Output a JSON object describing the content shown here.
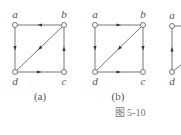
{
  "figure": {
    "caption": "图  5-10",
    "colors": {
      "edge": "#666666",
      "node_fill": "#ffffff",
      "node_stroke": "#666666",
      "text": "#555555"
    },
    "graphs": [
      {
        "id": "a",
        "label": "(a)",
        "label_pos": [
          40,
          100
        ],
        "nodes": [
          {
            "id": "a",
            "label": "a",
            "x": 15,
            "y": 25,
            "lx": 15,
            "ly": 18
          },
          {
            "id": "b",
            "label": "b",
            "x": 64,
            "y": 25,
            "lx": 64,
            "ly": 18
          },
          {
            "id": "c",
            "label": "c",
            "x": 64,
            "y": 72,
            "lx": 64,
            "ly": 85
          },
          {
            "id": "d",
            "label": "d",
            "x": 15,
            "y": 72,
            "lx": 15,
            "ly": 85
          }
        ],
        "edges": [
          {
            "from": "b",
            "to": "a"
          },
          {
            "from": "a",
            "to": "d"
          },
          {
            "from": "b",
            "to": "d"
          },
          {
            "from": "d",
            "to": "c"
          },
          {
            "from": "c",
            "to": "b"
          }
        ]
      },
      {
        "id": "b",
        "label": "(b)",
        "label_pos": [
          118,
          100
        ],
        "nodes": [
          {
            "id": "a",
            "label": "a",
            "x": 95,
            "y": 25,
            "lx": 95,
            "ly": 18
          },
          {
            "id": "b",
            "label": "b",
            "x": 143,
            "y": 25,
            "lx": 143,
            "ly": 18
          },
          {
            "id": "c",
            "label": "c",
            "x": 143,
            "y": 72,
            "lx": 143,
            "ly": 85
          },
          {
            "id": "d",
            "label": "d",
            "x": 95,
            "y": 72,
            "lx": 95,
            "ly": 85
          }
        ],
        "edges": [
          {
            "from": "a",
            "to": "b"
          },
          {
            "from": "a",
            "to": "d"
          },
          {
            "from": "b",
            "to": "d"
          },
          {
            "from": "b",
            "to": "c"
          },
          {
            "from": "d",
            "to": "c"
          }
        ]
      },
      {
        "id": "c",
        "label": "",
        "label_pos": [
          0,
          0
        ],
        "partial": true,
        "nodes": [
          {
            "id": "a",
            "label": "a",
            "x": 172,
            "y": 26,
            "lx": 172,
            "ly": 19
          },
          {
            "id": "d",
            "label": "d",
            "x": 172,
            "y": 72,
            "lx": 172,
            "ly": 85
          }
        ],
        "edges": [
          {
            "from": "d",
            "to": "a"
          }
        ],
        "stubs": [
          {
            "from": "a",
            "dx": 14,
            "dy": 0
          },
          {
            "from": "d",
            "dx": 10,
            "dy": -8
          }
        ]
      }
    ],
    "caption_pos": [
      130,
      116
    ]
  }
}
